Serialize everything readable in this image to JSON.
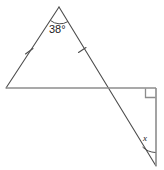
{
  "figure": {
    "stroke_color": "#4d4d4d",
    "text_color": "#1a1a1a",
    "background_color": "#ffffff",
    "stroke_width": 1
  },
  "labels": {
    "apex_angle": "38°",
    "unknown_angle": "x"
  },
  "markers": {
    "congruence_tick_left": "tick-mark",
    "congruence_tick_right": "tick-mark",
    "right_angle": "right-angle-square",
    "apex_arc": "angle-arc",
    "x_arc": "angle-arc"
  },
  "points": {
    "apex": [
      59,
      7
    ],
    "left_vertex": [
      6,
      88
    ],
    "intersection": [
      107,
      88
    ],
    "right_corner": [
      156,
      88
    ],
    "bottom_vertex": [
      156,
      166
    ]
  }
}
